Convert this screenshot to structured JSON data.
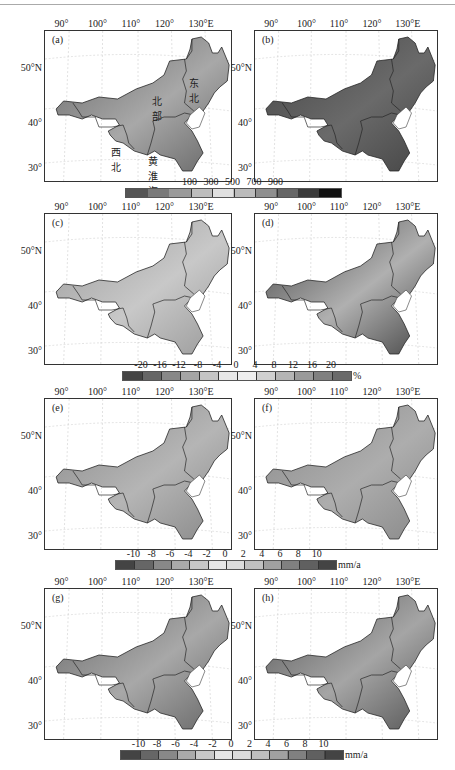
{
  "figure": {
    "lon_ticks": [
      "90°",
      "100°",
      "110°",
      "120°",
      "130°E"
    ],
    "lat_ticks": [
      "50°N",
      "40°",
      "30°"
    ],
    "region_labels": {
      "northeast": "东北",
      "north": "北部",
      "northwest": "西北",
      "huanghuaihai": "黄淮海"
    },
    "panels": [
      {
        "id": "a",
        "label": "(a)"
      },
      {
        "id": "b",
        "label": "(b)"
      },
      {
        "id": "c",
        "label": "(c)"
      },
      {
        "id": "d",
        "label": "(d)"
      },
      {
        "id": "e",
        "label": "(e)"
      },
      {
        "id": "f",
        "label": "(f)"
      },
      {
        "id": "g",
        "label": "(g)"
      },
      {
        "id": "h",
        "label": "(h)"
      }
    ],
    "colorbars": [
      {
        "id": "cb1",
        "labels": [
          "100",
          "300",
          "500",
          "700",
          "900"
        ],
        "unit": "",
        "colors": [
          "#555",
          "#7a7a7a",
          "#9a9a9a",
          "#bdbdbd",
          "#e0e0e0",
          "#bbbbbb",
          "#8f8f8f",
          "#666",
          "#3a3a3a",
          "#111"
        ]
      },
      {
        "id": "cb2",
        "labels": [
          "-20",
          "-16",
          "-12",
          "-8",
          "-4",
          "0",
          "4",
          "8",
          "12",
          "16",
          "20"
        ],
        "unit": "%",
        "colors": [
          "#444",
          "#666",
          "#888",
          "#a5a5a5",
          "#c5c5c5",
          "#e8e8e8",
          "#eeeeee",
          "#d0d0d0",
          "#b5b5b5",
          "#9a9a9a",
          "#808080",
          "#6a6a6a"
        ]
      },
      {
        "id": "cb3",
        "labels": [
          "-10",
          "-8",
          "-6",
          "-4",
          "-2",
          "0",
          "2",
          "4",
          "6",
          "8",
          "10"
        ],
        "unit": "mm/a",
        "colors": [
          "#444",
          "#666",
          "#888",
          "#aaa",
          "#c8c8c8",
          "#e5e5e5",
          "#dcdcdc",
          "#c0c0c0",
          "#a0a0a0",
          "#808080",
          "#606060",
          "#444"
        ]
      },
      {
        "id": "cb4",
        "labels": [
          "-10",
          "-8",
          "-6",
          "-4",
          "-2",
          "0",
          "2",
          "4",
          "6",
          "8",
          "10"
        ],
        "unit": "mm/a",
        "colors": [
          "#444",
          "#666",
          "#888",
          "#aaa",
          "#c8c8c8",
          "#e5e5e5",
          "#dcdcdc",
          "#c0c0c0",
          "#a0a0a0",
          "#808080",
          "#606060",
          "#444"
        ]
      }
    ]
  }
}
